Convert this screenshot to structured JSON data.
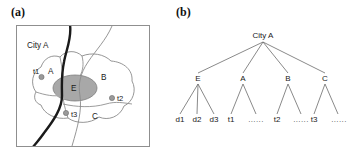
{
  "figure": {
    "panels": [
      {
        "id": "a",
        "label": "(a)",
        "type": "map"
      },
      {
        "id": "b",
        "label": "(b)",
        "type": "tree"
      }
    ]
  },
  "map": {
    "title": "City A",
    "frame_color": "#888888",
    "river_color": "#1a1a1a",
    "road_color": "#8a8a8a",
    "region_fill": "#ffffff",
    "core_fill": "#a8a8a8",
    "marker_fill": "#9a9a9a",
    "regions": [
      {
        "name": "A",
        "label": "A"
      },
      {
        "name": "B",
        "label": "B"
      },
      {
        "name": "C",
        "label": "C"
      },
      {
        "name": "E",
        "label": "E"
      }
    ],
    "markers": [
      {
        "name": "t1",
        "label": "t1"
      },
      {
        "name": "t2",
        "label": "t2"
      },
      {
        "name": "t3",
        "label": "t3"
      }
    ]
  },
  "tree": {
    "root": {
      "id": "city-a",
      "label": "City A"
    },
    "level1": [
      {
        "id": "E",
        "label": "E"
      },
      {
        "id": "A",
        "label": "A"
      },
      {
        "id": "B",
        "label": "B"
      },
      {
        "id": "C",
        "label": "C"
      }
    ],
    "leaves": [
      {
        "id": "d1",
        "label": "d1",
        "parent": "E"
      },
      {
        "id": "d2",
        "label": "d2",
        "parent": "E"
      },
      {
        "id": "d3",
        "label": "d3",
        "parent": "E"
      },
      {
        "id": "t1",
        "label": "t1",
        "parent": "A"
      },
      {
        "id": "a-more",
        "label": "......",
        "parent": "A"
      },
      {
        "id": "t2",
        "label": "t2",
        "parent": "B"
      },
      {
        "id": "b-more",
        "label": "......",
        "parent": "B"
      },
      {
        "id": "t3",
        "label": "t3",
        "parent": "C"
      },
      {
        "id": "c-more",
        "label": "......",
        "parent": "C"
      }
    ],
    "edge_color": "#6b6b6b"
  }
}
